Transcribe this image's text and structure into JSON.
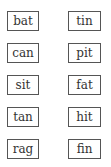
{
  "left_column": [
    "bat",
    "can",
    "sit",
    "tan",
    "rag"
  ],
  "right_column": [
    "tin",
    "pit",
    "fat",
    "hit",
    "fin"
  ]
}
